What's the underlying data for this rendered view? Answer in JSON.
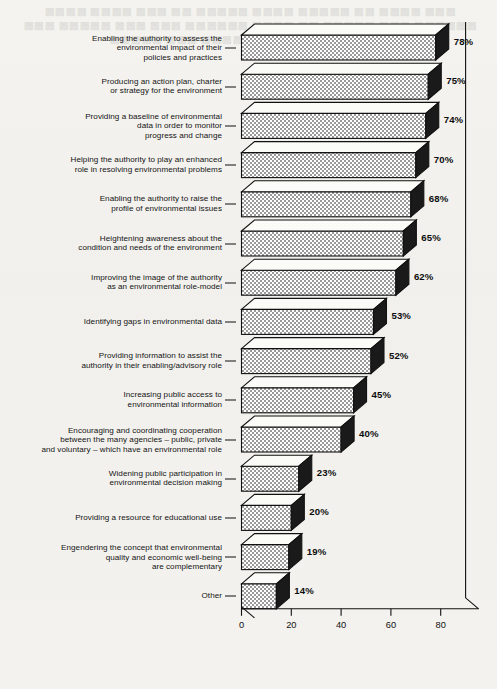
{
  "chart_data": {
    "type": "bar",
    "orientation": "horizontal",
    "title": "",
    "subtitle": "",
    "xlabel": "",
    "ylabel": "",
    "xlim": [
      0,
      90
    ],
    "xticks": [
      0,
      20,
      40,
      60,
      80
    ],
    "xtick_labels": [
      "0",
      "20",
      "40",
      "60",
      "80"
    ],
    "grid": false,
    "legend": false,
    "value_suffix": "%",
    "categories": [
      "Enabling the authority to assess the\nenvironmental impact of their\npolicies and practices",
      "Producing an action plan, charter\nor strategy for the environment",
      "Providing a baseline of environmental\ndata in order to monitor\nprogress and change",
      "Helping the authority to play an enhanced\nrole in resolving environmental problems",
      "Enabling the authority to raise the\nprofile of environmental issues",
      "Heightening awareness about the\ncondition and needs of the environment",
      "Improving the image of the authority\nas an environmental role-model",
      "Identifying gaps in environmental data",
      "Providing information to assist the\nauthority in their enabling/advisory role",
      "Increasing public access to\nenvironmental information",
      "Encouraging and coordinating cooperation\nbetween the many agencies – public, private\nand voluntary – which have an environmental role",
      "Widening public participation in\nenvironmental decision making",
      "Providing a resource for educational use",
      "Engendering the concept that environmental\nquality and economic well-being\nare complementary",
      "Other"
    ],
    "values": [
      78,
      75,
      74,
      70,
      68,
      65,
      62,
      53,
      52,
      45,
      40,
      23,
      20,
      19,
      14
    ],
    "value_labels": [
      "78%",
      "75%",
      "74%",
      "70%",
      "68%",
      "65%",
      "62%",
      "53%",
      "52%",
      "45%",
      "40%",
      "23%",
      "20%",
      "19%",
      "14%"
    ]
  },
  "style": {
    "bar_fill_light": "#d8d8d8",
    "bar_side_dark": "#1a1a1a",
    "bar_top_light": "#fbfbf8",
    "axis_color": "#111111",
    "background": "#f3f2ee"
  },
  "bleed_text": "the reverse side show-through of scanned page text"
}
